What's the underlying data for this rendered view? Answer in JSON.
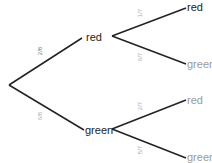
{
  "diagram": {
    "type": "probability-tree",
    "stage1": {
      "branches": [
        {
          "outcome": "red",
          "probability": "2/8"
        },
        {
          "outcome": "green",
          "probability": "6/8"
        }
      ]
    },
    "stage2": {
      "after_red": [
        {
          "outcome": "red",
          "probability": "1/7"
        },
        {
          "outcome": "green",
          "probability": "6/7"
        }
      ],
      "after_green": [
        {
          "outcome": "red",
          "probability": "2/7"
        },
        {
          "outcome": "green",
          "probability": "5/7"
        }
      ]
    }
  }
}
